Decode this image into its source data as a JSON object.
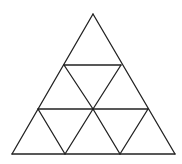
{
  "diagram": {
    "title": "",
    "stroke_color": "#222222",
    "background": "#ffffff",
    "outer_triangle": [
      [
        93,
        14
      ],
      [
        12,
        154
      ],
      [
        175,
        154
      ]
    ],
    "segments": [
      {
        "id": "outer-left",
        "from": [
          93,
          14
        ],
        "to": [
          12,
          154
        ]
      },
      {
        "id": "outer-right",
        "from": [
          93,
          14
        ],
        "to": [
          175,
          154
        ]
      },
      {
        "id": "base",
        "from": [
          12,
          154
        ],
        "to": [
          175,
          154
        ]
      },
      {
        "id": "upper-horizontal",
        "from": [
          64,
          65
        ],
        "to": [
          121,
          65
        ]
      },
      {
        "id": "middle-horizontal",
        "from": [
          38,
          109
        ],
        "to": [
          148,
          109
        ]
      },
      {
        "id": "upper-down-left",
        "from": [
          64,
          65
        ],
        "to": [
          93,
          109
        ]
      },
      {
        "id": "upper-down-right",
        "from": [
          121,
          65
        ],
        "to": [
          93,
          109
        ]
      },
      {
        "id": "lower-left-down-left",
        "from": [
          38,
          109
        ],
        "to": [
          65,
          154
        ]
      },
      {
        "id": "lower-left-down-right",
        "from": [
          93,
          109
        ],
        "to": [
          65,
          154
        ]
      },
      {
        "id": "lower-right-down-left",
        "from": [
          93,
          109
        ],
        "to": [
          120,
          154
        ]
      },
      {
        "id": "lower-right-down-right",
        "from": [
          148,
          109
        ],
        "to": [
          120,
          154
        ]
      }
    ]
  }
}
